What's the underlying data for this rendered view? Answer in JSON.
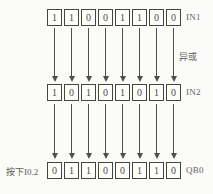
{
  "diagram": {
    "operation_label": "异或",
    "action_label": "按下I0.2",
    "rows": [
      {
        "label": "IN1",
        "bits": [
          "1",
          "1",
          "0",
          "0",
          "1",
          "1",
          "0",
          "0"
        ]
      },
      {
        "label": "IN2",
        "bits": [
          "1",
          "0",
          "1",
          "0",
          "1",
          "0",
          "1",
          "0"
        ]
      },
      {
        "label": "QB0",
        "bits": [
          "0",
          "1",
          "1",
          "0",
          "0",
          "1",
          "1",
          "0"
        ]
      }
    ],
    "colors": {
      "background": "#fbfbf9",
      "box_border": "#454543",
      "arrow": "#4f4f4d",
      "text": "#5d5d59"
    }
  }
}
